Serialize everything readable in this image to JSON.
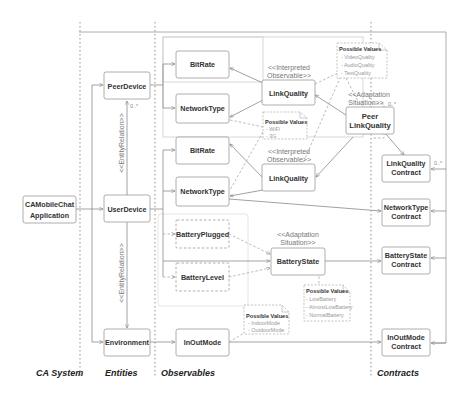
{
  "lanes": [
    {
      "label": "CA System"
    },
    {
      "label": "Entities"
    },
    {
      "label": "Observables"
    },
    {
      "label": "Contracts"
    }
  ],
  "system": {
    "line1": "CAMobileChat",
    "line2": "Application"
  },
  "entities": {
    "peer_device": "PeerDevice",
    "user_device": "UserDevice",
    "environment": "Environment",
    "relation_stereotype": "<<EntityRelation>>",
    "multiplicity": "0..*"
  },
  "observables": {
    "peer_bitrate": "BitRate",
    "peer_networktype": "NetworkType",
    "peer_linkquality": "LinkQuality",
    "user_bitrate": "BitRate",
    "user_networktype": "NetworkType",
    "user_linkquality": "LinkQuality",
    "battery_plugged": "BatteryPlugged",
    "battery_level": "BatteryLevel",
    "battery_state": "BatteryState",
    "inoutmode": "InOutMode",
    "peer_link_line1": "Peer",
    "peer_link_line2": "LinkQuality",
    "interpreted_line1": "<<Interpreted",
    "interpreted_line2": "Observable>>",
    "adaptation_line1": "<<Adaptation",
    "adaptation_line2": "Situation>>",
    "multiplicity": "0..*"
  },
  "notes": {
    "link_quality": {
      "title": "Possible Values",
      "items": [
        "- VideoQuality",
        "- AudioQuality",
        "- TextQuality"
      ]
    },
    "network_type": {
      "title": "Possible Values",
      "items": [
        "- WiFi",
        "- 3G"
      ]
    },
    "battery_state": {
      "title": "Possible Values",
      "items": [
        "- LowBattery",
        "- AlmostLowBattery",
        "- NormalBattery"
      ]
    },
    "inoutmode": {
      "title": "Possible Values",
      "items": [
        "- IndoorMode",
        "- OutdoorMode"
      ]
    }
  },
  "contracts": {
    "linkquality_line1": "LinkQuality",
    "linkquality_line2": "Contract",
    "networktype_line1": "NetworkType",
    "networktype_line2": "Contract",
    "batterystate_line1": "BatteryState",
    "batterystate_line2": "Contract",
    "inoutmode_line1": "InOutMode",
    "inoutmode_line2": "Contract",
    "multiplicity": "0..*"
  }
}
